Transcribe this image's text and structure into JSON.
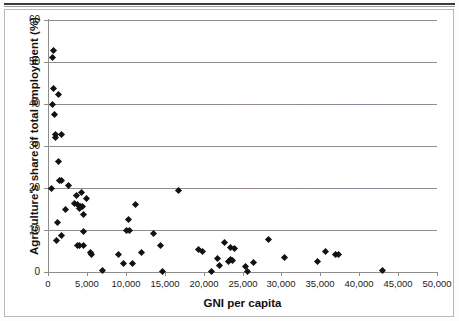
{
  "chart_data": {
    "type": "scatter",
    "title": "",
    "xlabel": "GNI per capita",
    "ylabel": "Agriculture's share of total employment (%)",
    "xlim": [
      0,
      50000
    ],
    "ylim": [
      0,
      60
    ],
    "xticks": [
      0,
      5000,
      10000,
      15000,
      20000,
      25000,
      30000,
      35000,
      40000,
      45000,
      50000
    ],
    "xticklabels": [
      "0",
      "5,000",
      "10,000",
      "15,000",
      "20,000",
      "25,000",
      "30,000",
      "35,000",
      "40,000",
      "45,000",
      "50,000"
    ],
    "yticks": [
      0,
      10,
      20,
      30,
      40,
      50,
      60
    ],
    "yticklabels": [
      "0",
      "10",
      "20",
      "30",
      "40",
      "50",
      "60"
    ],
    "grid": "horizontal",
    "legend": "none",
    "marker": "diamond",
    "marker_color": "#111111",
    "points": [
      {
        "x": 700,
        "y": 52.8
      },
      {
        "x": 600,
        "y": 51.0
      },
      {
        "x": 700,
        "y": 43.6
      },
      {
        "x": 1300,
        "y": 42.3
      },
      {
        "x": 600,
        "y": 40.0
      },
      {
        "x": 800,
        "y": 37.5
      },
      {
        "x": 900,
        "y": 32.8
      },
      {
        "x": 1000,
        "y": 32.0
      },
      {
        "x": 1700,
        "y": 32.7
      },
      {
        "x": 1400,
        "y": 26.4
      },
      {
        "x": 1500,
        "y": 21.9
      },
      {
        "x": 1700,
        "y": 21.8
      },
      {
        "x": 2600,
        "y": 20.5
      },
      {
        "x": 500,
        "y": 19.8
      },
      {
        "x": 16800,
        "y": 19.3
      },
      {
        "x": 3700,
        "y": 18.2
      },
      {
        "x": 4300,
        "y": 19.0
      },
      {
        "x": 5000,
        "y": 17.6
      },
      {
        "x": 3400,
        "y": 16.4
      },
      {
        "x": 3800,
        "y": 16.1
      },
      {
        "x": 4200,
        "y": 15.6
      },
      {
        "x": 4400,
        "y": 15.5
      },
      {
        "x": 4000,
        "y": 15.1
      },
      {
        "x": 2200,
        "y": 14.8
      },
      {
        "x": 4600,
        "y": 13.6
      },
      {
        "x": 11300,
        "y": 16.0
      },
      {
        "x": 10400,
        "y": 12.6
      },
      {
        "x": 1200,
        "y": 11.9
      },
      {
        "x": 10100,
        "y": 10.0
      },
      {
        "x": 10500,
        "y": 9.9
      },
      {
        "x": 4500,
        "y": 9.7
      },
      {
        "x": 13500,
        "y": 9.1
      },
      {
        "x": 1700,
        "y": 8.8
      },
      {
        "x": 1100,
        "y": 7.6
      },
      {
        "x": 28300,
        "y": 7.8
      },
      {
        "x": 22700,
        "y": 7.1
      },
      {
        "x": 3800,
        "y": 6.4
      },
      {
        "x": 4000,
        "y": 6.2
      },
      {
        "x": 4600,
        "y": 6.3
      },
      {
        "x": 14500,
        "y": 6.4
      },
      {
        "x": 23500,
        "y": 5.8
      },
      {
        "x": 24000,
        "y": 5.7
      },
      {
        "x": 19300,
        "y": 5.3
      },
      {
        "x": 19800,
        "y": 5.0
      },
      {
        "x": 5400,
        "y": 4.7
      },
      {
        "x": 5600,
        "y": 4.2
      },
      {
        "x": 9000,
        "y": 4.2
      },
      {
        "x": 12000,
        "y": 4.7
      },
      {
        "x": 35700,
        "y": 4.9
      },
      {
        "x": 36900,
        "y": 4.2
      },
      {
        "x": 37300,
        "y": 4.2
      },
      {
        "x": 30400,
        "y": 3.4
      },
      {
        "x": 21800,
        "y": 3.2
      },
      {
        "x": 23500,
        "y": 2.9
      },
      {
        "x": 23700,
        "y": 2.7
      },
      {
        "x": 23200,
        "y": 2.6
      },
      {
        "x": 26400,
        "y": 2.3
      },
      {
        "x": 34600,
        "y": 2.4
      },
      {
        "x": 9700,
        "y": 2.0
      },
      {
        "x": 10800,
        "y": 2.0
      },
      {
        "x": 22000,
        "y": 1.6
      },
      {
        "x": 25400,
        "y": 1.4
      },
      {
        "x": 7000,
        "y": 0.4
      },
      {
        "x": 14700,
        "y": 0.2
      },
      {
        "x": 21000,
        "y": 0.2
      },
      {
        "x": 25600,
        "y": 0.2
      },
      {
        "x": 43000,
        "y": 0.4
      }
    ]
  }
}
